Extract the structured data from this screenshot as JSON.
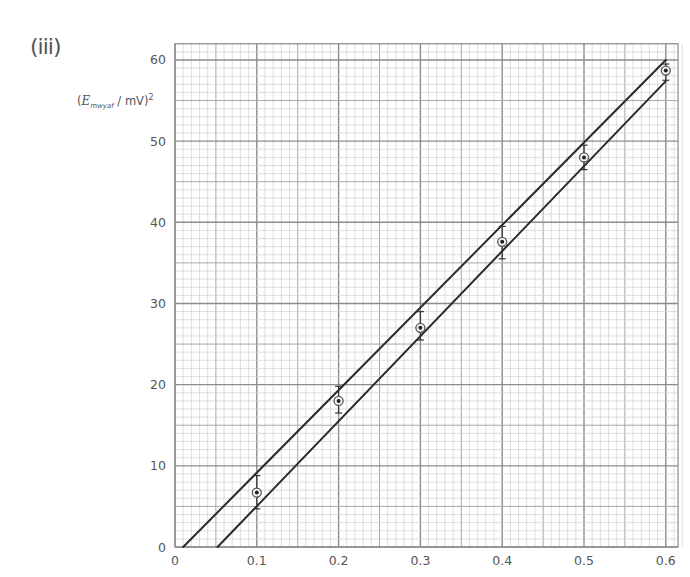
{
  "part_label": "(iii)",
  "y_axis_label": {
    "symbol": "E",
    "subscript": "mwyaf",
    "unit_text": " / mV)",
    "open_paren": "(",
    "power": "2"
  },
  "colors": {
    "background": "#ffffff",
    "minor_grid": "#d0d0d0",
    "medium_grid": "#a8a8a8",
    "major_grid": "#8c8c8c",
    "lines": "#2a2a2a",
    "points": "#222222",
    "tick_text": "#555555"
  },
  "chart_data": {
    "type": "scatter",
    "title": "",
    "xlabel": "",
    "ylabel": "(E_mwyaf / mV)^2",
    "xlim": [
      0,
      0.615
    ],
    "ylim": [
      0,
      62
    ],
    "grid": true,
    "x_ticks": [
      0,
      0.1,
      0.2,
      0.3,
      0.4,
      0.5,
      0.6
    ],
    "x_tick_labels": [
      "0",
      "0.1",
      "0.2",
      "0.3",
      "0.4",
      "0.5",
      "0.6"
    ],
    "y_ticks": [
      0,
      10,
      20,
      30,
      40,
      50,
      60
    ],
    "y_tick_labels": [
      "0",
      "10",
      "20",
      "30",
      "40",
      "50",
      "60"
    ],
    "series": [
      {
        "name": "data points",
        "marker": "circled-dot",
        "x": [
          0.1,
          0.2,
          0.3,
          0.4,
          0.5,
          0.6
        ],
        "y": [
          6.7,
          18.0,
          27.0,
          37.6,
          48.0,
          58.7
        ],
        "error_low": [
          4.7,
          16.5,
          25.5,
          35.5,
          46.5,
          57.5
        ],
        "error_high": [
          8.8,
          19.8,
          29.0,
          39.5,
          49.5,
          59.5
        ]
      },
      {
        "name": "steepest line",
        "type": "line",
        "x": [
          0.01,
          0.6
        ],
        "y": [
          0,
          60
        ]
      },
      {
        "name": "shallowest line",
        "type": "line",
        "x": [
          0.052,
          0.6
        ],
        "y": [
          0,
          57.4
        ]
      }
    ]
  }
}
